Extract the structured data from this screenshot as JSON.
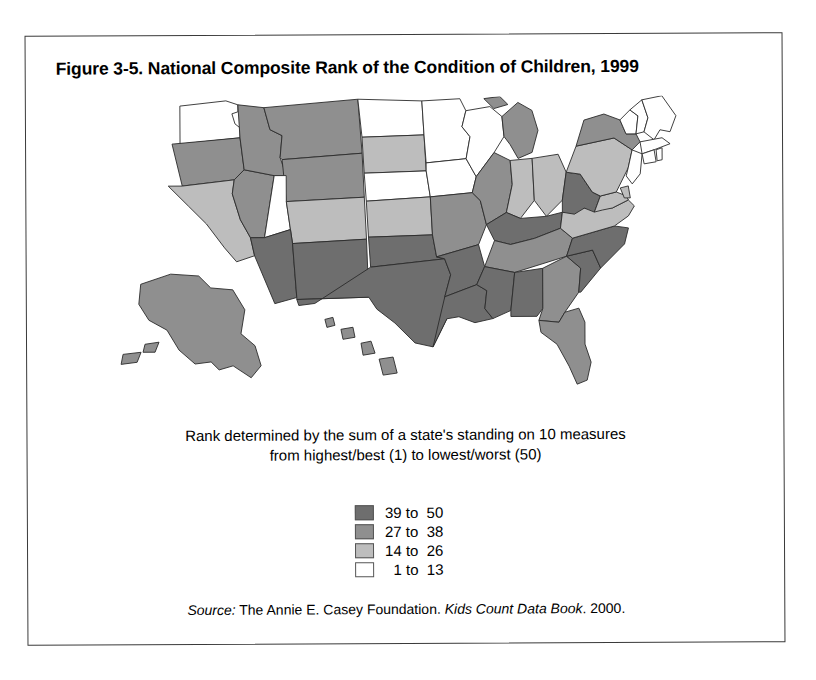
{
  "figure": {
    "title": "Figure 3-5. National Composite Rank of the Condition of Children, 1999",
    "caption_line1": "Rank determined by the sum of a state's standing on 10 measures",
    "caption_line2": "from highest/best (1) to lowest/worst (50)"
  },
  "source": {
    "label": "Source:",
    "publisher": " The Annie E. Casey Foundation. ",
    "publication": "Kids Count Data Book",
    "year": ". 2000."
  },
  "legend": {
    "items": [
      {
        "label": "39 to  50",
        "color": "#6e6e6e"
      },
      {
        "label": "27 to  38",
        "color": "#8f8f8f"
      },
      {
        "label": "14 to  26",
        "color": "#bdbdbd"
      },
      {
        "label": "  1 to  13",
        "color": "#ffffff"
      }
    ]
  },
  "chart_data": {
    "type": "choropleth",
    "title": "National Composite Rank of the Condition of Children, 1999",
    "value_description": "Composite rank from sum of a state's standing on 10 measures, 1 = highest/best, 50 = lowest/worst",
    "legend_position": "below-map-center",
    "bins": [
      {
        "label": "39 to  50",
        "min": 39,
        "max": 50,
        "color": "#6e6e6e"
      },
      {
        "label": "27 to  38",
        "min": 27,
        "max": 38,
        "color": "#8f8f8f"
      },
      {
        "label": "14 to  26",
        "min": 14,
        "max": 26,
        "color": "#bdbdbd"
      },
      {
        "label": "  1 to  13",
        "min": 1,
        "max": 13,
        "color": "#ffffff"
      }
    ],
    "states": [
      {
        "code": "AL",
        "name": "Alabama",
        "bin": 0
      },
      {
        "code": "AK",
        "name": "Alaska",
        "bin": 1
      },
      {
        "code": "AZ",
        "name": "Arizona",
        "bin": 0
      },
      {
        "code": "AR",
        "name": "Arkansas",
        "bin": 0
      },
      {
        "code": "CA",
        "name": "California",
        "bin": 2
      },
      {
        "code": "CO",
        "name": "Colorado",
        "bin": 2
      },
      {
        "code": "CT",
        "name": "Connecticut",
        "bin": 3
      },
      {
        "code": "DE",
        "name": "Delaware",
        "bin": 2
      },
      {
        "code": "FL",
        "name": "Florida",
        "bin": 1
      },
      {
        "code": "GA",
        "name": "Georgia",
        "bin": 1
      },
      {
        "code": "HI",
        "name": "Hawaii",
        "bin": 1
      },
      {
        "code": "ID",
        "name": "Idaho",
        "bin": 1
      },
      {
        "code": "IL",
        "name": "Illinois",
        "bin": 1
      },
      {
        "code": "IN",
        "name": "Indiana",
        "bin": 2
      },
      {
        "code": "IA",
        "name": "Iowa",
        "bin": 3
      },
      {
        "code": "KS",
        "name": "Kansas",
        "bin": 2
      },
      {
        "code": "KY",
        "name": "Kentucky",
        "bin": 0
      },
      {
        "code": "LA",
        "name": "Louisiana",
        "bin": 0
      },
      {
        "code": "ME",
        "name": "Maine",
        "bin": 3
      },
      {
        "code": "MD",
        "name": "Maryland",
        "bin": 2
      },
      {
        "code": "MA",
        "name": "Massachusetts",
        "bin": 3
      },
      {
        "code": "MI",
        "name": "Michigan",
        "bin": 1
      },
      {
        "code": "MN",
        "name": "Minnesota",
        "bin": 3
      },
      {
        "code": "MS",
        "name": "Mississippi",
        "bin": 0
      },
      {
        "code": "MO",
        "name": "Missouri",
        "bin": 1
      },
      {
        "code": "MT",
        "name": "Montana",
        "bin": 1
      },
      {
        "code": "NE",
        "name": "Nebraska",
        "bin": 3
      },
      {
        "code": "NV",
        "name": "Nevada",
        "bin": 1
      },
      {
        "code": "NH",
        "name": "New Hampshire",
        "bin": 3
      },
      {
        "code": "NJ",
        "name": "New Jersey",
        "bin": 3
      },
      {
        "code": "NM",
        "name": "New Mexico",
        "bin": 0
      },
      {
        "code": "NY",
        "name": "New York",
        "bin": 1
      },
      {
        "code": "NC",
        "name": "North Carolina",
        "bin": 0
      },
      {
        "code": "ND",
        "name": "North Dakota",
        "bin": 3
      },
      {
        "code": "OH",
        "name": "Ohio",
        "bin": 2
      },
      {
        "code": "OK",
        "name": "Oklahoma",
        "bin": 0
      },
      {
        "code": "OR",
        "name": "Oregon",
        "bin": 1
      },
      {
        "code": "PA",
        "name": "Pennsylvania",
        "bin": 2
      },
      {
        "code": "RI",
        "name": "Rhode Island",
        "bin": 3
      },
      {
        "code": "SC",
        "name": "South Carolina",
        "bin": 0
      },
      {
        "code": "SD",
        "name": "South Dakota",
        "bin": 2
      },
      {
        "code": "TN",
        "name": "Tennessee",
        "bin": 1
      },
      {
        "code": "TX",
        "name": "Texas",
        "bin": 0
      },
      {
        "code": "UT",
        "name": "Utah",
        "bin": 3
      },
      {
        "code": "VT",
        "name": "Vermont",
        "bin": 3
      },
      {
        "code": "VA",
        "name": "Virginia",
        "bin": 2
      },
      {
        "code": "WA",
        "name": "Washington",
        "bin": 3
      },
      {
        "code": "WV",
        "name": "West Virginia",
        "bin": 0
      },
      {
        "code": "WI",
        "name": "Wisconsin",
        "bin": 3
      },
      {
        "code": "WY",
        "name": "Wyoming",
        "bin": 1
      }
    ]
  }
}
